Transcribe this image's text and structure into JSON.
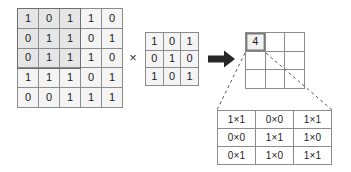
{
  "diagram": {
    "operator_multiply": "×",
    "arrow_icon": "right-arrow-icon"
  },
  "input_matrix": {
    "label": "input-matrix",
    "rows": 5,
    "cols": 5,
    "values": [
      [
        "1",
        "0",
        "1",
        "1",
        "0"
      ],
      [
        "0",
        "1",
        "1",
        "0",
        "1"
      ],
      [
        "0",
        "1",
        "1",
        "1",
        "0"
      ],
      [
        "1",
        "1",
        "1",
        "0",
        "1"
      ],
      [
        "0",
        "0",
        "1",
        "1",
        "1"
      ]
    ],
    "highlight": {
      "row_start": 0,
      "col_start": 0,
      "rows": 3,
      "cols": 3,
      "border_color": "#6e6e6e",
      "fill_color": "#e6e6e6"
    },
    "cell_fill": "#f4f4f4",
    "border_color": "#8c8c8c"
  },
  "kernel_matrix": {
    "label": "kernel-matrix",
    "rows": 3,
    "cols": 3,
    "values": [
      [
        "1",
        "0",
        "1"
      ],
      [
        "0",
        "1",
        "0"
      ],
      [
        "1",
        "0",
        "1"
      ]
    ],
    "cell_fill": "#f4f4f4",
    "border_color": "#8c8c8c"
  },
  "output_matrix": {
    "label": "output-matrix",
    "rows": 3,
    "cols": 3,
    "values": [
      [
        "4",
        "",
        ""
      ],
      [
        "",
        "",
        ""
      ],
      [
        "",
        "",
        ""
      ]
    ],
    "filled_cell": {
      "row": 0,
      "col": 0,
      "value": "4"
    },
    "cell_fill": "#ffffff",
    "border_color": "#8c8c8c"
  },
  "products_table": {
    "label": "products-table",
    "rows": 3,
    "cols": 3,
    "values": [
      [
        "1×1",
        "0×0",
        "1×1"
      ],
      [
        "0×0",
        "1×1",
        "1×0"
      ],
      [
        "0×1",
        "1×0",
        "1×1"
      ]
    ],
    "sum": "4",
    "cell_fill": "#ffffff",
    "border_color": "#8c8c8c"
  },
  "chart_data": {
    "type": "diagram",
    "input": [
      [
        1,
        0,
        1,
        1,
        0
      ],
      [
        0,
        1,
        1,
        0,
        1
      ],
      [
        0,
        1,
        1,
        1,
        0
      ],
      [
        1,
        1,
        1,
        0,
        1
      ],
      [
        0,
        0,
        1,
        1,
        1
      ]
    ],
    "kernel": [
      [
        1,
        0,
        1
      ],
      [
        0,
        1,
        0
      ],
      [
        1,
        0,
        1
      ]
    ],
    "output": [
      [
        4,
        null,
        null
      ],
      [
        null,
        null,
        null
      ],
      [
        null,
        null,
        null
      ]
    ],
    "elementwise_products": [
      [
        1,
        0,
        1
      ],
      [
        0,
        1,
        0
      ],
      [
        0,
        0,
        1
      ]
    ],
    "product_labels": [
      [
        "1×1",
        "0×0",
        "1×1"
      ],
      [
        "0×0",
        "1×1",
        "1×0"
      ],
      [
        "0×1",
        "1×0",
        "1×1"
      ]
    ],
    "sum": 4
  }
}
